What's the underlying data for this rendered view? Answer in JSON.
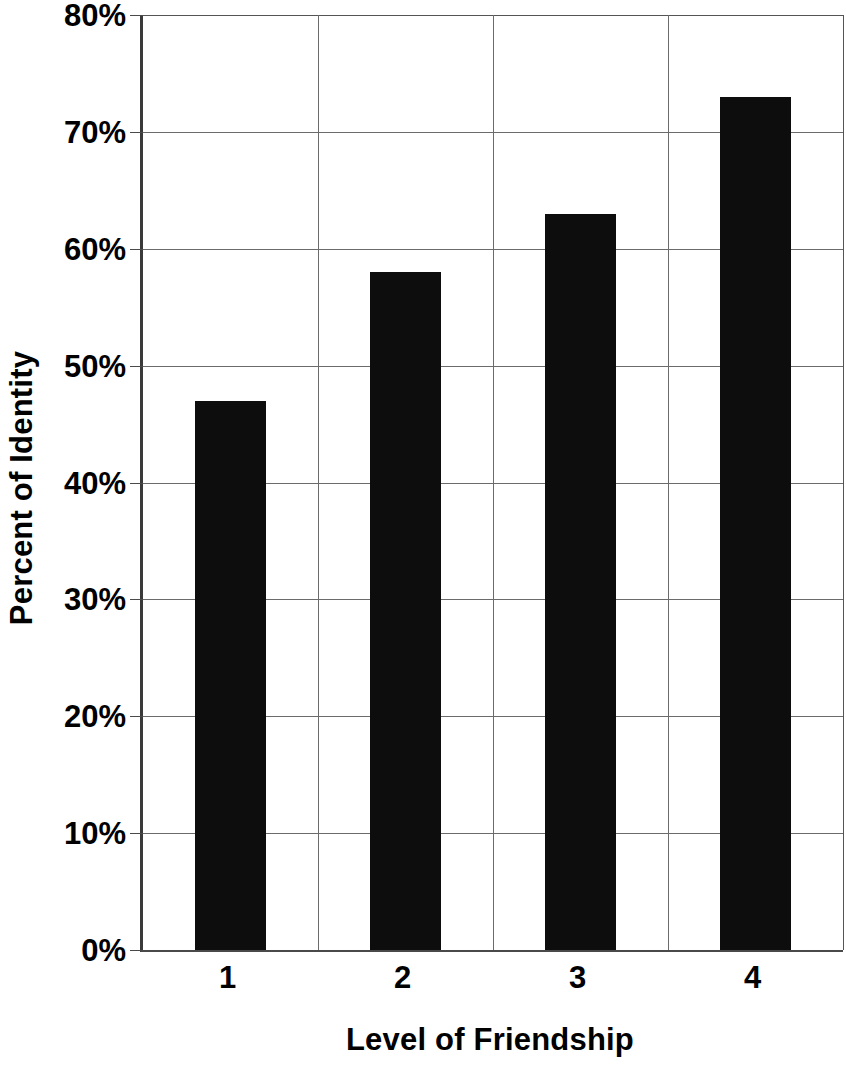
{
  "chart_data": {
    "type": "bar",
    "title": "",
    "xlabel": "Level of Friendship",
    "ylabel": "Percent of Identity",
    "categories": [
      "1",
      "2",
      "3",
      "4"
    ],
    "values": [
      47,
      58,
      63,
      73
    ],
    "value_labels": [
      "47%",
      "58%",
      "63%",
      "73%"
    ],
    "ylim": [
      0,
      80
    ],
    "ytick_values": [
      0,
      10,
      20,
      30,
      40,
      50,
      60,
      70,
      80
    ],
    "ytick_labels": [
      "0%",
      "10%",
      "20%",
      "30%",
      "40%",
      "50%",
      "60%",
      "70%",
      "80%"
    ],
    "xtick_labels": [
      "1",
      "2",
      "3",
      "4"
    ],
    "grid": "both",
    "legend": "none",
    "bar_color": "#0d0d0d",
    "grid_color": "#6b6b6b",
    "axis_color": "#4a4a4a",
    "background_color": "#ffffff",
    "series": [
      {
        "name": "Percent of Identity",
        "values": [
          47,
          58,
          63,
          73
        ]
      }
    ]
  }
}
